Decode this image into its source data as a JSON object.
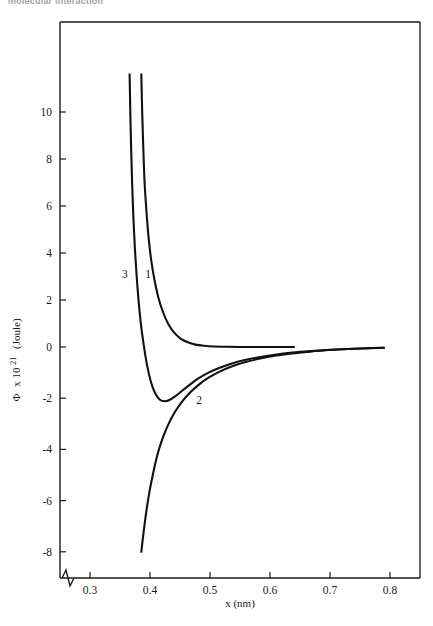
{
  "clipped_header": {
    "text": "molecular interaction"
  },
  "chart_data": {
    "type": "line",
    "title": "",
    "xlabel": "x (nm)",
    "ylabel": "Φ x 10²¹  (Joule)",
    "ylabel_symbol": "Φ",
    "ylabel_factor": "x 10",
    "ylabel_exponent": "21",
    "ylabel_units": "(Joule)",
    "xlim": [
      0.25,
      0.85
    ],
    "ylim": [
      -8,
      11.6
    ],
    "grid": false,
    "legend": "inline-curve-labels",
    "axis_break": true,
    "xticks": [
      0.3,
      0.4,
      0.5,
      0.6,
      0.7,
      0.8
    ],
    "xticklabels": [
      "0.3",
      "0.4",
      "0.5",
      "0.6",
      "0.7",
      "0.8"
    ],
    "yticks": [
      10,
      8,
      6,
      4,
      2,
      0,
      -2,
      -4,
      -6,
      -8
    ],
    "yticklabels": [
      "10",
      "8",
      "6",
      "4",
      "2",
      "0",
      "-2",
      "-4",
      "-6",
      "-8"
    ],
    "series": [
      {
        "name": "1",
        "label": "1",
        "label_x": 0.397,
        "label_y": 2.95,
        "color": "#111111",
        "points": [
          [
            0.3855,
            11.6
          ],
          [
            0.387,
            10.0
          ],
          [
            0.3888,
            8.5
          ],
          [
            0.391,
            7.0
          ],
          [
            0.394,
            5.8
          ],
          [
            0.3975,
            4.7
          ],
          [
            0.402,
            3.7
          ],
          [
            0.4075,
            2.85
          ],
          [
            0.414,
            2.1
          ],
          [
            0.4215,
            1.5
          ],
          [
            0.43,
            1.0
          ],
          [
            0.44,
            0.62
          ],
          [
            0.451,
            0.36
          ],
          [
            0.463,
            0.2
          ],
          [
            0.476,
            0.1
          ],
          [
            0.49,
            0.05
          ],
          [
            0.506,
            0.02
          ],
          [
            0.525,
            0.01
          ],
          [
            0.55,
            0.0
          ],
          [
            0.58,
            0.0
          ],
          [
            0.61,
            0.0
          ],
          [
            0.64,
            0.0
          ]
        ]
      },
      {
        "name": "2",
        "label": "2",
        "label_x": 0.482,
        "label_y": -2.22,
        "color": "#111111",
        "points": [
          [
            0.3855,
            -8.0
          ],
          [
            0.3895,
            -7.2
          ],
          [
            0.394,
            -6.4
          ],
          [
            0.3995,
            -5.6
          ],
          [
            0.4055,
            -4.9
          ],
          [
            0.4125,
            -4.2
          ],
          [
            0.4205,
            -3.6
          ],
          [
            0.43,
            -3.05
          ],
          [
            0.4405,
            -2.58
          ],
          [
            0.4525,
            -2.16
          ],
          [
            0.466,
            -1.8
          ],
          [
            0.481,
            -1.48
          ],
          [
            0.4975,
            -1.2
          ],
          [
            0.516,
            -0.96
          ],
          [
            0.536,
            -0.76
          ],
          [
            0.558,
            -0.6
          ],
          [
            0.582,
            -0.46
          ],
          [
            0.608,
            -0.34
          ],
          [
            0.636,
            -0.25
          ],
          [
            0.666,
            -0.18
          ],
          [
            0.698,
            -0.12
          ],
          [
            0.732,
            -0.08
          ],
          [
            0.768,
            -0.05
          ],
          [
            0.79,
            -0.03
          ]
        ]
      },
      {
        "name": "3",
        "label": "3",
        "label_x": 0.358,
        "label_y": 2.95,
        "color": "#111111",
        "points": [
          [
            0.366,
            11.6
          ],
          [
            0.3672,
            10.0
          ],
          [
            0.3686,
            8.4
          ],
          [
            0.3703,
            6.9
          ],
          [
            0.3723,
            5.5
          ],
          [
            0.3748,
            4.2
          ],
          [
            0.3778,
            3.0
          ],
          [
            0.3812,
            1.9
          ],
          [
            0.3852,
            0.9
          ],
          [
            0.3898,
            0.05
          ],
          [
            0.395,
            -0.7
          ],
          [
            0.401,
            -1.32
          ],
          [
            0.408,
            -1.78
          ],
          [
            0.416,
            -2.05
          ],
          [
            0.425,
            -2.12
          ],
          [
            0.434,
            -2.05
          ],
          [
            0.4435,
            -1.9
          ],
          [
            0.454,
            -1.7
          ],
          [
            0.466,
            -1.48
          ],
          [
            0.48,
            -1.24
          ],
          [
            0.496,
            -1.02
          ],
          [
            0.514,
            -0.83
          ],
          [
            0.534,
            -0.66
          ],
          [
            0.556,
            -0.52
          ],
          [
            0.581,
            -0.4
          ],
          [
            0.608,
            -0.3
          ],
          [
            0.637,
            -0.22
          ],
          [
            0.668,
            -0.16
          ],
          [
            0.701,
            -0.11
          ],
          [
            0.736,
            -0.07
          ],
          [
            0.77,
            -0.04
          ],
          [
            0.79,
            -0.03
          ]
        ]
      }
    ]
  }
}
